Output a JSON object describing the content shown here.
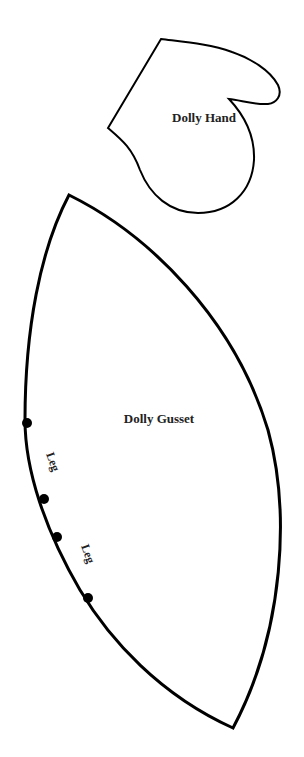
{
  "pieces": {
    "hand": {
      "label": "Dolly Hand"
    },
    "gusset": {
      "label": "Dolly Gusset",
      "markers": [
        "Leg",
        "Leg"
      ]
    }
  },
  "colors": {
    "line": "#000000",
    "background": "#ffffff",
    "text": "#222222"
  }
}
